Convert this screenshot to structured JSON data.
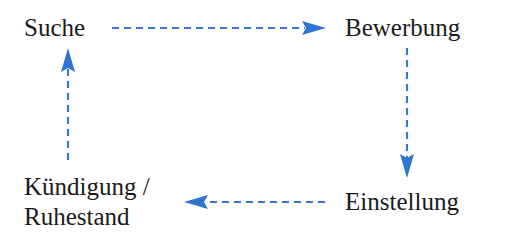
{
  "diagram": {
    "title": "",
    "nodes": [
      {
        "id": "suche",
        "label": "Suche"
      },
      {
        "id": "bewerbung",
        "label": "Bewerbung"
      },
      {
        "id": "einstellung",
        "label": "Einstellung"
      },
      {
        "id": "kuendigung",
        "label_line1": "Kündigung /",
        "label_line2": "Ruhestand"
      }
    ],
    "edges": [
      {
        "from": "suche",
        "to": "bewerbung",
        "style": "dashed"
      },
      {
        "from": "bewerbung",
        "to": "einstellung",
        "style": "dashed"
      },
      {
        "from": "einstellung",
        "to": "kuendigung",
        "style": "dashed"
      },
      {
        "from": "kuendigung",
        "to": "suche",
        "style": "dashed"
      }
    ],
    "colors": {
      "arrow": "#2f74d0",
      "text": "#1a1a1a"
    }
  }
}
